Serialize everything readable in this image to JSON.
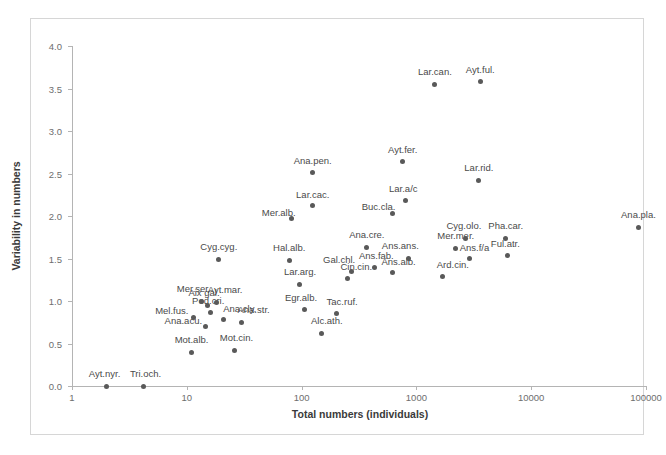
{
  "chart_data": {
    "type": "scatter",
    "title": "",
    "xlabel": "Total numbers (individuals)",
    "ylabel": "Variability in numbers",
    "xscale": "log",
    "yscale": "linear",
    "xlim": [
      1,
      100000
    ],
    "ylim": [
      0.0,
      4.0
    ],
    "xticks": [
      "1",
      "10",
      "100",
      "1000",
      "10000",
      "100000"
    ],
    "yticks": [
      "0.0",
      "0.5",
      "1.0",
      "1.5",
      "2.0",
      "2.5",
      "3.0",
      "3.5",
      "4.0"
    ],
    "grid": false,
    "legend": "none",
    "marker_color": "#595959",
    "points": [
      {
        "label": "Ayt.nyr.",
        "x": 2,
        "y": 0.0,
        "lx": -2,
        "ly": -7
      },
      {
        "label": "Tri.och.",
        "x": 4.2,
        "y": 0.0,
        "lx": 2,
        "ly": -7
      },
      {
        "label": "Mot.alb.",
        "x": 11,
        "y": 0.4,
        "lx": 0,
        "ly": -7
      },
      {
        "label": "Ana.acu.",
        "x": 14.5,
        "y": 0.7,
        "lx": -22,
        "ly": -1
      },
      {
        "label": "Mel.fus.",
        "x": 11.5,
        "y": 0.81,
        "lx": -22,
        "ly": -1
      },
      {
        "label": "Mot.cin.",
        "x": 26,
        "y": 0.42,
        "lx": 2,
        "ly": -7
      },
      {
        "label": "Ana.str.",
        "x": 30,
        "y": 0.75,
        "lx": 12,
        "ly": -7
      },
      {
        "label": "Pod.cri.",
        "x": 16,
        "y": 0.86,
        "lx": -2,
        "ly": -7
      },
      {
        "label": "Ana.cly.",
        "x": 21,
        "y": 0.78,
        "lx": 16,
        "ly": -6
      },
      {
        "label": "Aix gal.",
        "x": 15,
        "y": 0.95,
        "lx": -3,
        "ly": -7
      },
      {
        "label": "Mer.ser.",
        "x": 13.5,
        "y": 1.0,
        "lx": -8,
        "ly": -7
      },
      {
        "label": "Ayt.mar.",
        "x": 18,
        "y": 0.98,
        "lx": 9,
        "ly": -8
      },
      {
        "label": "Cyg.cyg.",
        "x": 19,
        "y": 1.49,
        "lx": 0,
        "ly": -7
      },
      {
        "label": "Alc.ath.",
        "x": 150,
        "y": 0.62,
        "lx": 5,
        "ly": -7
      },
      {
        "label": "Egr.alb.",
        "x": 105,
        "y": 0.9,
        "lx": -3,
        "ly": -7
      },
      {
        "label": "Tac.ruf.",
        "x": 200,
        "y": 0.85,
        "lx": 6,
        "ly": -7
      },
      {
        "label": "Lar.arg.",
        "x": 95,
        "y": 1.2,
        "lx": 1,
        "ly": -7
      },
      {
        "label": "Cin.cin.",
        "x": 250,
        "y": 1.27,
        "lx": 9,
        "ly": -6
      },
      {
        "label": "Gal.chl.",
        "x": 270,
        "y": 1.35,
        "lx": -12,
        "ly": -6
      },
      {
        "label": "Hal.alb.",
        "x": 78,
        "y": 1.48,
        "lx": 0,
        "ly": -7
      },
      {
        "label": "Ans.fab.",
        "x": 430,
        "y": 1.4,
        "lx": 2,
        "ly": -6
      },
      {
        "label": "Ana.cre.",
        "x": 370,
        "y": 1.63,
        "lx": 0,
        "ly": -7
      },
      {
        "label": "Ans.alb.",
        "x": 620,
        "y": 1.33,
        "lx": 6,
        "ly": -6
      },
      {
        "label": "Ans.ans.",
        "x": 850,
        "y": 1.5,
        "lx": -8,
        "ly": -8
      },
      {
        "label": "Ard.cin.",
        "x": 1700,
        "y": 1.29,
        "lx": 10,
        "ly": -6
      },
      {
        "label": "Mer.mer.",
        "x": 2200,
        "y": 1.62,
        "lx": 0,
        "ly": -7
      },
      {
        "label": "Ans.f/a",
        "x": 2900,
        "y": 1.5,
        "lx": 5,
        "ly": -6
      },
      {
        "label": "Cyg.olo.",
        "x": 2700,
        "y": 1.74,
        "lx": -2,
        "ly": -7
      },
      {
        "label": "Ful.atr.",
        "x": 6200,
        "y": 1.54,
        "lx": -2,
        "ly": -6
      },
      {
        "label": "Pha.car.",
        "x": 6000,
        "y": 1.74,
        "lx": 0,
        "ly": -7
      },
      {
        "label": "Ana.pla.",
        "x": 86000,
        "y": 1.87,
        "lx": 0,
        "ly": -7
      },
      {
        "label": "Mer.alb.",
        "x": 82,
        "y": 1.97,
        "lx": -13,
        "ly": -1
      },
      {
        "label": "Lar.cac.",
        "x": 125,
        "y": 2.12,
        "lx": 0,
        "ly": -6
      },
      {
        "label": "Ana.pen.",
        "x": 125,
        "y": 2.51,
        "lx": 0,
        "ly": -7
      },
      {
        "label": "Buc.cla.",
        "x": 620,
        "y": 2.03,
        "lx": -14,
        "ly": -1
      },
      {
        "label": "Lar.a/c",
        "x": 800,
        "y": 2.18,
        "lx": -2,
        "ly": -7
      },
      {
        "label": "Ayt.fer.",
        "x": 760,
        "y": 2.64,
        "lx": 0,
        "ly": -7
      },
      {
        "label": "Lar.rid.",
        "x": 3500,
        "y": 2.42,
        "lx": 0,
        "ly": -7
      },
      {
        "label": "Lar.can.",
        "x": 1450,
        "y": 3.55,
        "lx": 0,
        "ly": -7
      },
      {
        "label": "Ayt.ful.",
        "x": 3600,
        "y": 3.58,
        "lx": 0,
        "ly": -7
      }
    ]
  }
}
